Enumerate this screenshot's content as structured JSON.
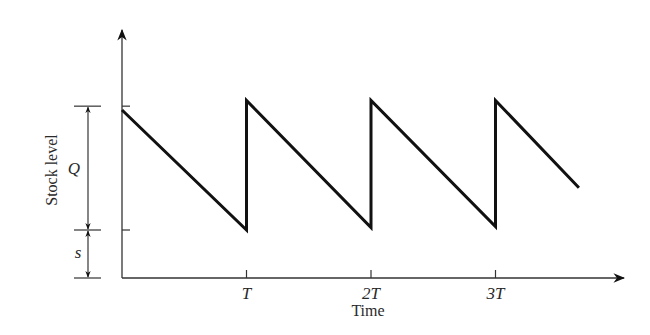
{
  "chart_data": {
    "type": "line",
    "title": "",
    "xlabel": "Time",
    "ylabel": "Stock level",
    "x_ticks": [
      {
        "value": 1,
        "label": "T"
      },
      {
        "value": 2,
        "label": "2T"
      },
      {
        "value": 3,
        "label": "3T"
      }
    ],
    "xlim": [
      0,
      3.05
    ],
    "ylim": [
      0,
      4.9
    ],
    "series": [
      {
        "name": "Stock level",
        "points": [
          {
            "x": 0,
            "y": 3.5
          },
          {
            "x": 1,
            "y": 1.0
          },
          {
            "x": 1,
            "y": 3.7
          },
          {
            "x": 2,
            "y": 1.05
          },
          {
            "x": 2,
            "y": 3.7
          },
          {
            "x": 3,
            "y": 1.07
          },
          {
            "x": 3,
            "y": 3.7
          },
          {
            "x": 3.67,
            "y": 1.88
          }
        ]
      }
    ],
    "annotations": {
      "levels": {
        "zero": 0,
        "s": 1.0,
        "s_plus_Q": 3.58
      },
      "Q_label": "Q",
      "s_label": "s"
    },
    "grid": false,
    "legend": "none"
  },
  "colors": {
    "line": "#111111",
    "axis": "#333333",
    "text": "#2a2a2a"
  }
}
